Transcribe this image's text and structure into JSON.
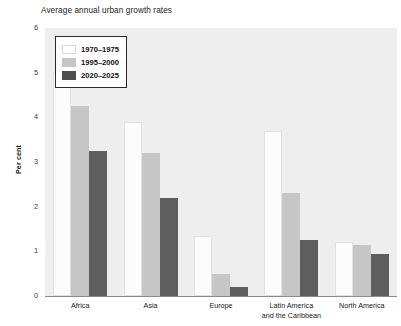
{
  "chart_data": {
    "type": "bar",
    "title": "Average annual urban growth rates",
    "xlabel": "",
    "ylabel": "Per cent",
    "ylim": [
      0,
      6
    ],
    "yticks": [
      0,
      1,
      2,
      3,
      4,
      5,
      6
    ],
    "grid": false,
    "legend_position": "top-left inside plot",
    "categories": [
      "Africa",
      "Asia",
      "Europe",
      "Latin America and the Caribbean",
      "North America"
    ],
    "category_labels": [
      [
        "Africa"
      ],
      [
        "Asia"
      ],
      [
        "Europe"
      ],
      [
        "Latin America",
        "and the Caribbean"
      ],
      [
        "North America"
      ]
    ],
    "series": [
      {
        "name": "1970–1975",
        "color": "#ffffff",
        "values": [
          5.0,
          3.9,
          1.35,
          3.7,
          1.2
        ]
      },
      {
        "name": "1995–2000",
        "color": "#c6c6c6",
        "values": [
          4.25,
          3.2,
          0.5,
          2.3,
          1.15
        ]
      },
      {
        "name": "2020–2025",
        "color": "#5e5e5e",
        "values": [
          3.25,
          2.2,
          0.2,
          1.25,
          0.95
        ]
      }
    ]
  },
  "axis": {
    "y_tick_labels": [
      "0",
      "1",
      "2",
      "3",
      "4",
      "5",
      "6"
    ],
    "y_title": "Per cent"
  },
  "legend": {
    "entries": [
      {
        "label": "1970–1975",
        "swatch": "series-0-swatch"
      },
      {
        "label": "1995–2000",
        "swatch": "series-1-swatch"
      },
      {
        "label": "2020–2025",
        "swatch": "series-2-swatch"
      }
    ]
  }
}
